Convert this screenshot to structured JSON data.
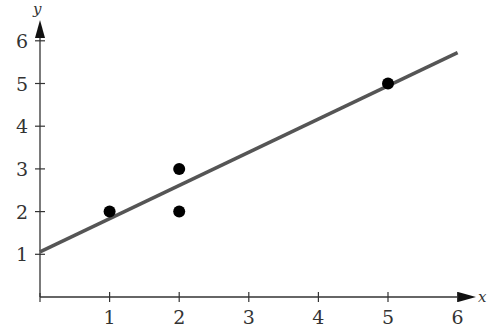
{
  "chart_data": {
    "type": "scatter",
    "title": "",
    "xlabel": "x",
    "ylabel": "y",
    "xlim": [
      0,
      6
    ],
    "ylim": [
      0,
      6
    ],
    "grid": false,
    "legend": null,
    "x_ticks": [
      "1",
      "2",
      "3",
      "4",
      "5",
      "6"
    ],
    "y_ticks": [
      "1",
      "2",
      "3",
      "4",
      "5",
      "6"
    ],
    "series": [
      {
        "name": "data points",
        "type": "scatter",
        "points": [
          {
            "x": 1,
            "y": 2
          },
          {
            "x": 2,
            "y": 3
          },
          {
            "x": 2,
            "y": 2
          },
          {
            "x": 5,
            "y": 5
          }
        ]
      },
      {
        "name": "least-squares line",
        "type": "line",
        "slope": 0.778,
        "intercept": 1.056,
        "x_range": [
          0,
          6
        ]
      }
    ]
  },
  "colors": {
    "axis": "#333333",
    "line": "#555555",
    "point": "#000000"
  }
}
